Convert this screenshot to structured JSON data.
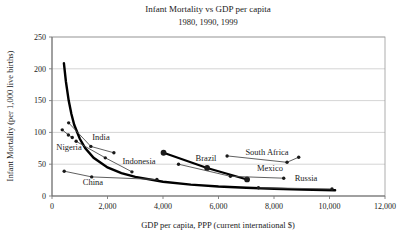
{
  "chart_data": {
    "type": "scatter",
    "title": "Infant Mortality vs GDP per capita",
    "subtitle": "1980, 1990, 1999",
    "xlabel": "GDP per capita, PPP (current international $)",
    "ylabel": "Infant Mortality (per 1,000 live births)",
    "years_shown": [
      "1980",
      "1990",
      "1999"
    ],
    "xlim": [
      0,
      12000
    ],
    "ylim": [
      0,
      250
    ],
    "grid": "horizontal",
    "legend_position": "none",
    "x_ticks": [
      {
        "value": 0,
        "label": "0"
      },
      {
        "value": 2000,
        "label": "2,000"
      },
      {
        "value": 4000,
        "label": "4,000"
      },
      {
        "value": 6000,
        "label": "6,000"
      },
      {
        "value": 8000,
        "label": "8,000"
      },
      {
        "value": 10000,
        "label": "10,000"
      },
      {
        "value": 12000,
        "label": "12,000"
      }
    ],
    "y_ticks": [
      {
        "value": 0,
        "label": "0"
      },
      {
        "value": 50,
        "label": "50"
      },
      {
        "value": 100,
        "label": "100"
      },
      {
        "value": 150,
        "label": "150"
      },
      {
        "value": 200,
        "label": "200"
      },
      {
        "value": 250,
        "label": "250"
      }
    ],
    "fitted_curve": {
      "name": "cross-country fitted curve",
      "points": [
        [
          430,
          209
        ],
        [
          500,
          180
        ],
        [
          600,
          150
        ],
        [
          700,
          129
        ],
        [
          800,
          112
        ],
        [
          1000,
          90
        ],
        [
          1200,
          75
        ],
        [
          1500,
          60
        ],
        [
          2000,
          45
        ],
        [
          2500,
          36
        ],
        [
          3000,
          30
        ],
        [
          4000,
          22.5
        ],
        [
          5000,
          18
        ],
        [
          6000,
          15
        ],
        [
          7000,
          13
        ],
        [
          8000,
          11.3
        ],
        [
          9000,
          10
        ],
        [
          10200,
          9
        ]
      ]
    },
    "series": [
      {
        "name": "Nigeria",
        "points": [
          [
            370,
            104
          ],
          [
            590,
            96
          ],
          [
            730,
            92
          ]
        ],
        "style": "thin",
        "label_anchor_px": [
          69,
          150
        ]
      },
      {
        "name": "India",
        "points": [
          [
            600,
            115
          ],
          [
            1400,
            78
          ],
          [
            2230,
            68
          ]
        ],
        "style": "thin",
        "label_anchor_px": [
          101,
          140
        ]
      },
      {
        "name": "Indonesia",
        "points": [
          [
            870,
            86
          ],
          [
            1920,
            60
          ],
          [
            2880,
            38
          ]
        ],
        "style": "thin",
        "label_anchor_px": [
          139,
          164
        ]
      },
      {
        "name": "China",
        "points": [
          [
            440,
            39
          ],
          [
            1430,
            30
          ],
          [
            3780,
            26
          ]
        ],
        "style": "thin",
        "label_anchor_px": [
          93,
          185
        ]
      },
      {
        "name": "Brazil",
        "points": [
          [
            4020,
            68
          ],
          [
            5590,
            44
          ],
          [
            7030,
            26
          ]
        ],
        "style": "thick",
        "label_anchor_px": [
          206,
          161
        ]
      },
      {
        "name": "Mexico",
        "points": [
          [
            4560,
            50
          ],
          [
            6430,
            31
          ],
          [
            8350,
            28
          ]
        ],
        "style": "thin",
        "label_anchor_px": [
          270,
          171
        ]
      },
      {
        "name": "South Africa",
        "points": [
          [
            6310,
            63
          ],
          [
            8470,
            53
          ],
          [
            8890,
            61
          ]
        ],
        "style": "thin",
        "label_anchor_px": [
          267,
          155
        ]
      },
      {
        "name": "Russia",
        "points": [
          [
            7440,
            13
          ],
          [
            10090,
            11
          ]
        ],
        "style": "thin",
        "label_anchor_px": [
          306,
          181
        ]
      }
    ],
    "colors": {
      "curve": "#000000",
      "thick_series": "#000000",
      "thin_series": "#4d4d4d",
      "marker": "#1a1a1a",
      "gridline": "#c9c9c9",
      "border": "#9a9a9a",
      "axis": "#6b6b6b",
      "text": "#1a1a1a"
    }
  }
}
